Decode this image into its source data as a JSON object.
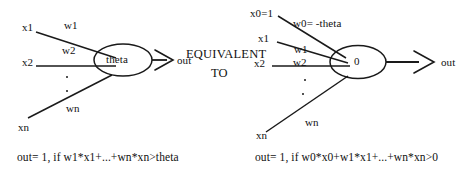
{
  "figure": {
    "background_color": "#ffffff",
    "ink_color": "#1a1a1a"
  },
  "equivalence": {
    "line1": "EQUIVALENT",
    "line2": "TO"
  },
  "left_diagram": {
    "node_label": "theta",
    "output_label": "out",
    "inputs": [
      {
        "name": "x1",
        "weight": "w1"
      },
      {
        "name": "x2",
        "weight": "w2"
      },
      {
        "name": "xn",
        "weight": "wn"
      }
    ],
    "ellipsis": ".",
    "formula": "out= 1, if w1*x1+...+wn*xn>theta"
  },
  "right_diagram": {
    "node_label": "0",
    "output_label": "out",
    "inputs": [
      {
        "name": "x0=1",
        "weight": "w0= -theta"
      },
      {
        "name": "x1",
        "weight": "w1"
      },
      {
        "name": "x2",
        "weight": "w2"
      },
      {
        "name": "xn",
        "weight": "wn"
      }
    ],
    "ellipsis": ".",
    "formula": "out= 1, if w0*x0+w1*x1+...+wn*xn>0"
  }
}
